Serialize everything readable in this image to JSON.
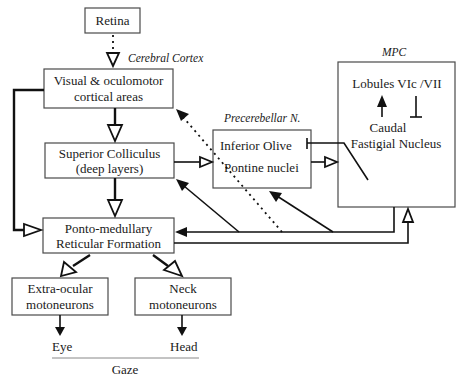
{
  "diagram": {
    "nodes": {
      "retina": {
        "label": "Retina"
      },
      "visual_cortex": {
        "line1": "Visual & oculomotor",
        "line2": "cortical areas"
      },
      "superior_colliculus": {
        "line1": "Superior Colliculus",
        "line2": "(deep layers)"
      },
      "ponto_medullary": {
        "line1": "Ponto-medullary",
        "line2": "Reticular Formation"
      },
      "extraocular": {
        "line1": "Extra-ocular",
        "line2": "motoneurons"
      },
      "neck": {
        "line1": "Neck",
        "line2": "motoneurons"
      },
      "precerebellar": {
        "line1": "Inferior Olive",
        "line2": "Pontine nuclei"
      },
      "mpc": {
        "line1": "Lobules VIc /VII",
        "line2": "Caudal",
        "line3": "Fastigial Nucleus"
      }
    },
    "group_labels": {
      "cerebral_cortex": "Cerebral Cortex",
      "precerebellar": "Precerebellar N.",
      "mpc": "MPC"
    },
    "outputs": {
      "eye": "Eye",
      "head": "Head",
      "gaze": "Gaze"
    },
    "edges": [
      {
        "from": "Retina",
        "to": "Visual & oculomotor cortical areas",
        "style": "dotted, open arrowhead"
      },
      {
        "from": "Visual & oculomotor cortical areas",
        "to": "Superior Colliculus",
        "style": "thick, open arrowhead"
      },
      {
        "from": "Visual & oculomotor cortical areas",
        "to": "Ponto-medullary Reticular Formation",
        "style": "thick, open arrowhead"
      },
      {
        "from": "Superior Colliculus",
        "to": "Ponto-medullary Reticular Formation",
        "style": "thick, open arrowhead"
      },
      {
        "from": "Superior Colliculus",
        "to": "Precerebellar N.",
        "style": "thin, open arrowhead"
      },
      {
        "from": "Precerebellar N.",
        "to": "MPC",
        "style": "thin, open arrowhead"
      },
      {
        "from": "Caudal Fastigial Nucleus",
        "to": "Inferior Olive",
        "style": "inhibitory bar"
      },
      {
        "from": "Caudal Fastigial Nucleus",
        "to": "Lobules VIc/VII",
        "style": "solid arrowhead"
      },
      {
        "from": "Lobules VIc/VII",
        "to": "Caudal Fastigial Nucleus",
        "style": "inhibitory bar"
      },
      {
        "from": "Caudal Fastigial Nucleus",
        "to": "Ponto-medullary Reticular Formation",
        "style": "solid arrowhead"
      },
      {
        "from": "Caudal Fastigial Nucleus",
        "to": "Superior Colliculus",
        "style": "solid arrowhead"
      },
      {
        "from": "Caudal Fastigial Nucleus",
        "to": "Pontine nuclei",
        "style": "solid arrowhead"
      },
      {
        "from": "Caudal Fastigial Nucleus",
        "to": "Visual & oculomotor cortical areas",
        "style": "dotted, solid arrowhead"
      },
      {
        "from": "Ponto-medullary Reticular Formation",
        "to": "MPC",
        "style": "thin, open arrowhead"
      },
      {
        "from": "Ponto-medullary Reticular Formation",
        "to": "Extra-ocular motoneurons",
        "style": "thick, open arrowhead"
      },
      {
        "from": "Ponto-medullary Reticular Formation",
        "to": "Neck motoneurons",
        "style": "thick, open arrowhead"
      },
      {
        "from": "Extra-ocular motoneurons",
        "to": "Eye",
        "style": "solid arrowhead"
      },
      {
        "from": "Neck motoneurons",
        "to": "Head",
        "style": "solid arrowhead"
      }
    ]
  }
}
